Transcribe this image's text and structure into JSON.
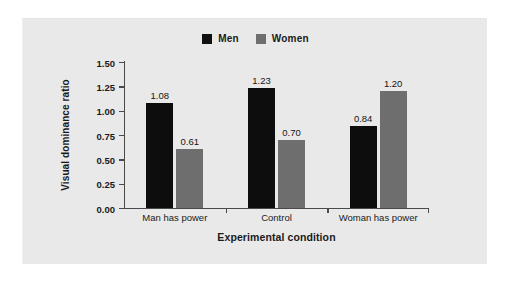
{
  "chart_data": {
    "type": "bar",
    "title": "",
    "xlabel": "Experimental condition",
    "ylabel": "Visual dominance ratio",
    "categories": [
      "Man has power",
      "Control",
      "Woman has power"
    ],
    "series": [
      {
        "name": "Men",
        "color": "#0d0d0d",
        "values": [
          1.08,
          1.23,
          0.84
        ]
      },
      {
        "name": "Women",
        "color": "#6e6e6e",
        "values": [
          0.61,
          0.7,
          1.2
        ]
      }
    ],
    "ylim": [
      0.0,
      1.5
    ],
    "ytick_labels": [
      "0.00",
      "0.25",
      "0.50",
      "0.75",
      "1.00",
      "1.25",
      "1.50"
    ],
    "ytick_values": [
      0.0,
      0.25,
      0.5,
      0.75,
      1.0,
      1.25,
      1.5
    ],
    "value_labels": [
      [
        "1.08",
        "0.61"
      ],
      [
        "1.23",
        "0.70"
      ],
      [
        "0.84",
        "1.20"
      ]
    ],
    "grid": false,
    "legend_position": "top-center",
    "legend": [
      {
        "label": "Men",
        "swatch": "black-square-icon"
      },
      {
        "label": "Women",
        "swatch": "gray-square-icon"
      }
    ]
  },
  "figure": {
    "background_color": "#ffffff",
    "panel_color": "#e9e9e9",
    "axis_color": "#4a4a4a",
    "text_color": "#1a1a1a"
  }
}
